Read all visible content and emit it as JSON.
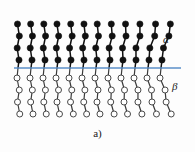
{
  "figure": {
    "caption": "a)",
    "background_color": "#fdfdfd"
  },
  "labels": {
    "alpha": "α",
    "beta": "β"
  },
  "interface": {
    "color": "#5b8fc9",
    "label": "interface-line",
    "x_start": 14,
    "x_end": 181,
    "y": 68,
    "thickness": 1.6
  },
  "chart_data": {
    "type": "diagram",
    "title": "a)",
    "chain_count": 12,
    "beads_per_alpha_chain": 4,
    "beads_per_beta_chain": 4,
    "blocks": [
      {
        "name": "α",
        "label": "alpha",
        "region": "above-interface",
        "bead_style": "filled",
        "bead_fill": "#111111",
        "bead_stroke": "#111111",
        "bead_radius": 3.1,
        "bond_color": "#111111",
        "bond_width": 1.5
      },
      {
        "name": "β",
        "label": "beta",
        "region": "below-interface",
        "bead_style": "open",
        "bead_fill": "#ffffff",
        "bead_stroke": "#4a4a4a",
        "bead_radius": 3.0,
        "bond_color": "#3a3a3a",
        "bond_width": 1.2
      }
    ],
    "chain_anchor_x": [
      18,
      31,
      44,
      57,
      70,
      83,
      96,
      109,
      122,
      135,
      148,
      161
    ],
    "alpha_bead_y": [
      24,
      36,
      48,
      60
    ],
    "beta_bead_y": [
      78,
      90,
      102,
      114
    ],
    "alpha_tilt_px": [
      2,
      2,
      2,
      2,
      3,
      3,
      3,
      4,
      5,
      6,
      8,
      9
    ],
    "beta_tilt_px": [
      3,
      3,
      3,
      3,
      4,
      4,
      4,
      5,
      5,
      6,
      7,
      8
    ],
    "xlabel": "",
    "ylabel": "",
    "grid": false,
    "legend": [
      "α",
      "β"
    ],
    "legend_position": "right"
  }
}
